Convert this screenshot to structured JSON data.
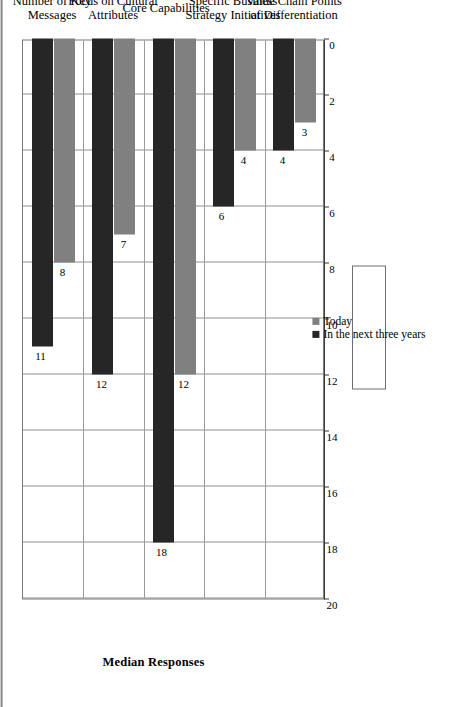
{
  "chart_data": {
    "type": "bar",
    "orientation": "horizontal",
    "title": "",
    "xlabel": "",
    "ylabel": "Median Responses",
    "value_axis_label": "Median Responses",
    "ylim": [
      0,
      20
    ],
    "tick_labels": [
      "0",
      "2",
      "4",
      "6",
      "8",
      "10",
      "12",
      "14",
      "16",
      "18",
      "20"
    ],
    "tick_values": [
      0,
      2,
      4,
      6,
      8,
      10,
      12,
      14,
      16,
      18,
      20
    ],
    "grid": true,
    "legend_position": "top-right",
    "categories": [
      "Value Chain Points of Differentiation",
      "Specific Business Strategy Initiatives",
      "Core Capabilities",
      "Focus on Cultural Attributes",
      "Number of Key Messages"
    ],
    "category_lines": [
      [
        "Value Chain Points",
        "of Differentiation"
      ],
      [
        "Specific Business",
        "Strategy Initiatives"
      ],
      [
        "Core Capabilities",
        ""
      ],
      [
        "Focus on Cultural",
        "Attributes"
      ],
      [
        "Number of Key",
        "Messages"
      ]
    ],
    "series": [
      {
        "name": "Today",
        "color": "#808080",
        "values": [
          3,
          4,
          12,
          7,
          8
        ]
      },
      {
        "name": "In the next three years",
        "color": "#262626",
        "values": [
          4,
          6,
          18,
          12,
          11
        ]
      }
    ]
  },
  "legend": {
    "entries": [
      {
        "label": "Today",
        "swatch": "today"
      },
      {
        "label": "In the next three years",
        "swatch": "future"
      }
    ]
  },
  "axis": {
    "value_title": "Median Responses"
  }
}
